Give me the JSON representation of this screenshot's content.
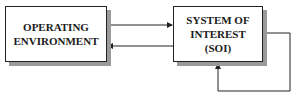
{
  "diagram": {
    "nodes": [
      {
        "id": "env",
        "label_line1": "OPERATING",
        "label_line2": "ENVIRONMENT"
      },
      {
        "id": "soi",
        "label_line1": "SYSTEM OF",
        "label_line2": "INTEREST",
        "label_line3": "(SOI)"
      }
    ],
    "edges": [
      {
        "from": "env",
        "to": "soi",
        "direction": "right"
      },
      {
        "from": "soi",
        "to": "env",
        "direction": "left"
      },
      {
        "from": "soi",
        "to": "soi",
        "type": "feedback-loop"
      }
    ],
    "colors": {
      "line": "#222222",
      "shadow": "#9a9a9a",
      "text": "#1a1a1a",
      "background": "#ffffff"
    }
  }
}
